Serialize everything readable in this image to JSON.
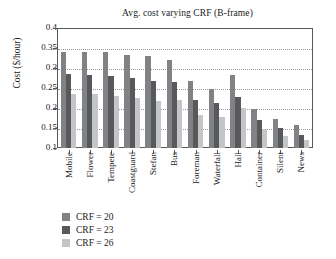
{
  "chart_data": {
    "type": "bar",
    "title": "Avg. cost varying CRF (B-frame)",
    "xlabel": "",
    "ylabel": "Cost ($/hour)",
    "ylim": [
      0.1,
      0.4
    ],
    "yticks": [
      "0.4",
      "0.35",
      "0.3",
      "0.25",
      "0.2",
      "0.15",
      "0.1"
    ],
    "ytick_values": [
      0.4,
      0.35,
      0.3,
      0.25,
      0.2,
      0.15,
      0.1
    ],
    "grid": true,
    "grid_style": "dotted-horizontal",
    "legend_position": "below-left",
    "categories": [
      "Mobile",
      "Flower",
      "Tempete",
      "Coastguard",
      "Stefan",
      "Bus",
      "Foreman",
      "Waterfall",
      "Hall",
      "Container",
      "Silent",
      "News"
    ],
    "series": [
      {
        "name": "CRF = 20",
        "color": "#808285",
        "values": [
          0.341,
          0.341,
          0.342,
          0.334,
          0.333,
          0.322,
          0.268,
          0.249,
          0.285,
          0.199,
          0.173,
          0.159
        ]
      },
      {
        "name": "CRF = 23",
        "color": "#58595b",
        "values": [
          0.287,
          0.285,
          0.281,
          0.277,
          0.27,
          0.266,
          0.222,
          0.213,
          0.228,
          0.17,
          0.15,
          0.133
        ]
      },
      {
        "name": "CRF = 26",
        "color": "#c3c5c7",
        "values": [
          0.237,
          0.237,
          0.231,
          0.226,
          0.219,
          0.221,
          0.184,
          0.177,
          0.2,
          0.148,
          0.13,
          0.121
        ]
      }
    ]
  },
  "legend": {
    "items": [
      {
        "label": "CRF = 20",
        "color": "#808285"
      },
      {
        "label": "CRF = 23",
        "color": "#58595b"
      },
      {
        "label": "CRF = 26",
        "color": "#c3c5c7"
      }
    ]
  }
}
